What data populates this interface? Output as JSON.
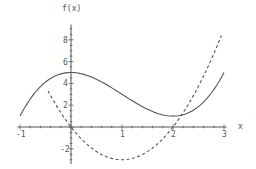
{
  "chart_data": {
    "type": "line",
    "title": "",
    "xlabel": "x",
    "ylabel": "f(x)",
    "xlim": [
      -1.1,
      3.1
    ],
    "ylim": [
      -3.4,
      9.5
    ],
    "grid": false,
    "legend": null,
    "x_ticks": [
      -1,
      1,
      2,
      3
    ],
    "x_tick_labels": [
      "-1",
      "1",
      "2",
      "3"
    ],
    "y_ticks": [
      -2,
      2,
      4,
      6,
      8
    ],
    "y_tick_labels": [
      "-2",
      "2",
      "4",
      "6",
      "8"
    ],
    "series": [
      {
        "name": "f(x)",
        "style": "solid",
        "formula": "x^3 - 3x^2 + 5",
        "x": [
          -1,
          -0.5,
          0,
          0.5,
          1,
          1.5,
          2,
          2.5,
          3
        ],
        "values": [
          1,
          4.125,
          5,
          4.375,
          3,
          1.625,
          1,
          1.875,
          5
        ]
      },
      {
        "name": "f'(x)",
        "style": "dashed",
        "formula": "3x^2 - 6x",
        "x": [
          -0.45,
          0,
          0.5,
          1,
          1.5,
          2,
          2.5,
          2.95
        ],
        "values": [
          3.31,
          0,
          -2.25,
          -3,
          -2.25,
          0,
          3.75,
          8.41
        ]
      }
    ]
  },
  "axes": {
    "x_label": "x",
    "y_label": "f(x)"
  },
  "colors": {
    "axis": "#555555",
    "curve": "#555555",
    "background": "#ffffff"
  }
}
